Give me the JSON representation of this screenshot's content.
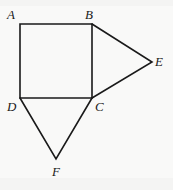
{
  "figure": {
    "background_color": "#f9f9f8",
    "stroke_color": "#1a1a1a",
    "stroke_width": 1.6,
    "width": 173,
    "height": 190,
    "vertices": [
      {
        "id": "A",
        "label": "A",
        "x": 20,
        "y": 24,
        "label_x": 7,
        "label_y": 8
      },
      {
        "id": "B",
        "label": "B",
        "x": 92,
        "y": 24,
        "label_x": 85,
        "label_y": 8
      },
      {
        "id": "C",
        "label": "C",
        "x": 92,
        "y": 98,
        "label_x": 95,
        "label_y": 100
      },
      {
        "id": "D",
        "label": "D",
        "x": 20,
        "y": 98,
        "label_x": 7,
        "label_y": 100
      },
      {
        "id": "E",
        "label": "E",
        "x": 152,
        "y": 62,
        "label_x": 155,
        "label_y": 55
      },
      {
        "id": "F",
        "label": "F",
        "x": 56,
        "y": 159,
        "label_x": 52,
        "label_y": 165
      }
    ],
    "shapes": [
      {
        "name": "square-abcd",
        "kind": "polygon",
        "points": "20,24 92,24 92,98 20,98",
        "closed": true
      },
      {
        "name": "triangle-bce",
        "kind": "polyline",
        "points": "92,24 152,62 92,98",
        "closed": false
      },
      {
        "name": "triangle-dcf",
        "kind": "polyline",
        "points": "20,98 56,159 92,98",
        "closed": false
      }
    ],
    "edges": [
      {
        "name": "edge-AB",
        "from": "A",
        "to": "B"
      },
      {
        "name": "edge-BC",
        "from": "B",
        "to": "C"
      },
      {
        "name": "edge-CD",
        "from": "C",
        "to": "D"
      },
      {
        "name": "edge-DA",
        "from": "D",
        "to": "A"
      },
      {
        "name": "edge-BE",
        "from": "B",
        "to": "E"
      },
      {
        "name": "edge-CE",
        "from": "C",
        "to": "E"
      },
      {
        "name": "edge-DF",
        "from": "D",
        "to": "F"
      },
      {
        "name": "edge-CF",
        "from": "C",
        "to": "F"
      }
    ]
  }
}
